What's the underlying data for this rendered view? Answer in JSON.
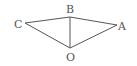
{
  "diagram": {
    "type": "geometry",
    "points": {
      "A": {
        "label": "A",
        "x": 117,
        "y": 25,
        "lx": 118,
        "ly": 30
      },
      "B": {
        "label": "B",
        "x": 70,
        "y": 17,
        "lx": 66,
        "ly": 13
      },
      "C": {
        "label": "C",
        "x": 25,
        "y": 23,
        "lx": 14,
        "ly": 28
      },
      "O": {
        "label": "O",
        "x": 70,
        "y": 48,
        "lx": 66,
        "ly": 61
      }
    },
    "segments": [
      [
        "C",
        "B"
      ],
      [
        "B",
        "A"
      ],
      [
        "C",
        "O"
      ],
      [
        "O",
        "A"
      ],
      [
        "B",
        "O"
      ]
    ],
    "line_color": "#555555"
  }
}
